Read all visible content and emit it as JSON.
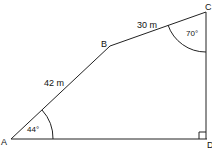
{
  "diagram": {
    "points": {
      "A": {
        "label": "A",
        "x": 11,
        "y": 139
      },
      "B": {
        "label": "B",
        "x": 110,
        "y": 46
      },
      "C": {
        "label": "C",
        "x": 206,
        "y": 12
      },
      "D": {
        "label": "D",
        "x": 207,
        "y": 139
      }
    },
    "edges": [
      {
        "from": "A",
        "to": "B",
        "label": "42 m"
      },
      {
        "from": "B",
        "to": "C",
        "label": "30 m"
      },
      {
        "from": "C",
        "to": "D",
        "label": ""
      },
      {
        "from": "A",
        "to": "D",
        "label": ""
      }
    ],
    "angles": {
      "at_A": "44°",
      "at_C": "70°",
      "at_D": "right-angle"
    },
    "colors": {
      "line": "#222222",
      "background": "#ffffff"
    }
  }
}
